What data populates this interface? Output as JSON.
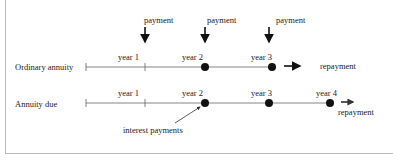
{
  "diagram": {
    "payment_label": "payment",
    "rows": [
      {
        "label": "Ordinary annuity",
        "years": [
          "year 1",
          "year 2",
          "year 3"
        ],
        "end_label": "repayment"
      },
      {
        "label": "Annuity due",
        "years": [
          "year 1",
          "year 2",
          "year 3",
          "year 4"
        ],
        "end_label": "repayment"
      }
    ],
    "annotation": "interest payments",
    "colors": {
      "line": "#555555",
      "dot": "#111111",
      "border": "#b8b8b8"
    }
  }
}
